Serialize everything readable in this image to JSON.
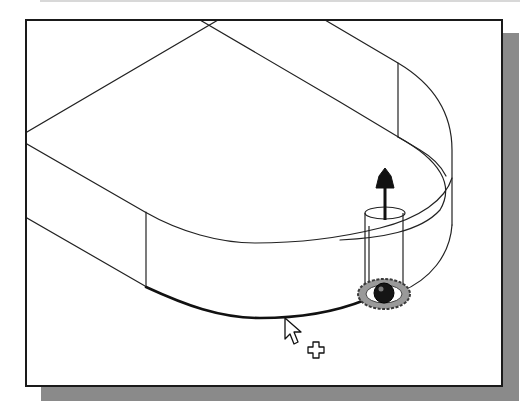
{
  "view": {
    "kind": "3D CAD viewport, wireframe part with drag manipulator",
    "frame_color": "#1a1a1a",
    "background_color": "#ffffff",
    "shadow_color": "#8a8a8a",
    "line_color": "#222222",
    "highlight_edge_color": "#111111"
  },
  "part": {
    "description": "Slot-shaped extruded plate with rounded end, shown in isometric wireframe"
  },
  "manipulator": {
    "arrow_icon": "drag-arrow-up",
    "ring_icon": "rotation-ring",
    "sphere_color": "#151515",
    "ring_color": "#6a6a6a"
  },
  "cursor": {
    "type": "arrow-with-plus",
    "label": "+"
  },
  "labels": {
    "viewport": "Graphics window",
    "selected_edge": "Selected edge"
  }
}
